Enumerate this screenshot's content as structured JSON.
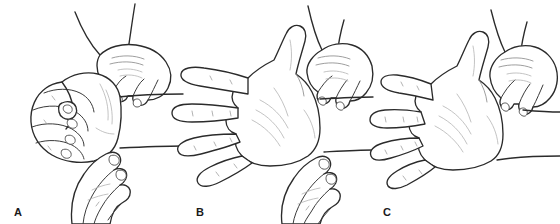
{
  "figure": {
    "kind": "medical-line-illustration",
    "background_color": "#ffffff",
    "ink_color": "#2b2b2b",
    "shading_color": "#b4b4b4",
    "panel_count": 3
  },
  "panels": [
    {
      "id": "A",
      "label": "A",
      "hand_position": "closed fist",
      "subject_hand": "fist with flexed fingers, radial side toward viewer",
      "examiner_hands": 2,
      "examiner_upper": "fingers pressed on dorsal wrist from above",
      "examiner_lower": "fingers pressed on volar wrist from below",
      "forearm_lines": 2
    },
    {
      "id": "B",
      "label": "B",
      "hand_position": "open hand, fingers extended and spread",
      "subject_hand": "palm facing viewer, thumb abducted upward, four fingers spread horizontally",
      "examiner_hands": 2,
      "examiner_upper": "fingers pressed on dorsal wrist from above",
      "examiner_lower": "fingers pressed on volar wrist from below",
      "forearm_lines": 2
    },
    {
      "id": "C",
      "label": "C",
      "hand_position": "open hand, fingers extended and spread",
      "subject_hand": "palm facing viewer, thumb abducted upward, four fingers spread horizontally",
      "examiner_hands": 1,
      "examiner_upper": "fingers pressed on dorsal wrist from above",
      "examiner_lower": "",
      "forearm_lines": 1
    }
  ]
}
